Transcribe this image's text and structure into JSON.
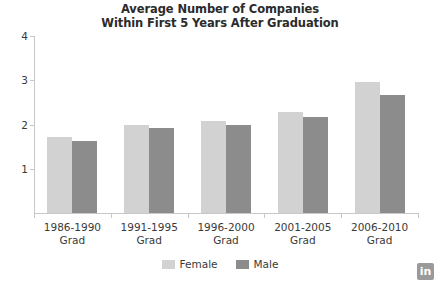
{
  "chart_data": {
    "type": "bar",
    "title": "Average Number of Companies Within First 5 Years After Graduation",
    "title_lines": [
      "Average Number of Companies",
      "Within First 5 Years After Graduation"
    ],
    "xlabel": "",
    "ylabel": "",
    "ylim": [
      0,
      4
    ],
    "yticks": [
      1,
      2,
      3,
      4
    ],
    "ytick_labels": [
      "1",
      "2",
      "3",
      "4"
    ],
    "grid": false,
    "legend_position": "bottom",
    "categories": [
      "1986-1990 Grad",
      "1991-1995 Grad",
      "1996-2000 Grad",
      "2001-2005 Grad",
      "2006-2010 Grad"
    ],
    "category_lines": [
      [
        "1986-1990",
        "Grad"
      ],
      [
        "1991-1995",
        "Grad"
      ],
      [
        "1996-2000",
        "Grad"
      ],
      [
        "2001-2005",
        "Grad"
      ],
      [
        "2006-2010",
        "Grad"
      ]
    ],
    "series": [
      {
        "name": "Female",
        "color": "#d2d2d2",
        "values": [
          1.71,
          1.98,
          2.08,
          2.28,
          2.95
        ]
      },
      {
        "name": "Male",
        "color": "#8c8c8c",
        "values": [
          1.62,
          1.93,
          2.0,
          2.18,
          2.67
        ]
      }
    ]
  },
  "branding": {
    "logo_text": "in",
    "logo_color": "#9a9a9a"
  },
  "colors": {
    "axis": "#c8c8c8",
    "text": "#3a3a3a",
    "title": "#2b2b2b",
    "background": "#ffffff"
  }
}
